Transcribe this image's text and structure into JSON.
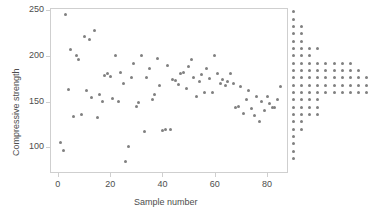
{
  "chart_data": {
    "type": "scatter",
    "title": "",
    "xlabel": "Sample number",
    "ylabel": "Compressive strength",
    "xlim": [
      -3,
      88
    ],
    "ylim": [
      72,
      252
    ],
    "xticks": [
      0,
      20,
      40,
      60,
      80
    ],
    "xtick_labels": [
      "0",
      "20",
      "40",
      "60",
      "80"
    ],
    "yticks": [
      100,
      150,
      200,
      250
    ],
    "ytick_labels": [
      "100",
      "150",
      "200",
      "250"
    ],
    "grid": false,
    "legend": "none",
    "marker_color": "#808080",
    "axis_color": "#cfcfcf",
    "text_color": "#4d4d4d",
    "x": [
      1,
      2,
      3,
      4,
      5,
      6,
      7,
      8,
      9,
      10,
      11,
      12,
      13,
      14,
      15,
      16,
      17,
      18,
      19,
      20,
      21,
      22,
      23,
      24,
      25,
      26,
      27,
      28,
      29,
      30,
      31,
      32,
      33,
      34,
      35,
      36,
      37,
      38,
      39,
      40,
      41,
      42,
      43,
      44,
      45,
      46,
      47,
      48,
      49,
      50,
      51,
      52,
      53,
      54,
      55,
      56,
      57,
      58,
      59,
      60,
      61,
      62,
      63,
      64,
      65,
      66,
      67,
      68,
      69,
      70,
      71,
      72,
      73,
      74,
      75,
      76,
      77,
      78,
      79,
      80,
      81,
      82,
      83,
      84,
      85
    ],
    "y": [
      105,
      97,
      245,
      163,
      207,
      134,
      200,
      196,
      136,
      221,
      162,
      218,
      154,
      228,
      133,
      158,
      150,
      178,
      181,
      177,
      153,
      200,
      150,
      182,
      170,
      85,
      101,
      176,
      191,
      145,
      149,
      200,
      117,
      176,
      186,
      152,
      158,
      197,
      167,
      118,
      120,
      189,
      119,
      174,
      173,
      169,
      181,
      182,
      164,
      188,
      196,
      176,
      156,
      172,
      179,
      160,
      186,
      175,
      160,
      200,
      181,
      170,
      174,
      167,
      172,
      181,
      170,
      144,
      145,
      166,
      137,
      152,
      162,
      142,
      135,
      156,
      128,
      150,
      140,
      155,
      148,
      144,
      143,
      152,
      166
    ],
    "dot_plot": {
      "description": "Horizontal dot plot (frequency distribution) of compressive strength at right of scatter",
      "orientation": "horizontal",
      "bin_values": [
        248,
        240,
        232,
        224,
        216,
        208,
        200,
        192,
        184,
        176,
        168,
        160,
        152,
        144,
        136,
        128,
        120,
        112,
        104,
        96,
        88
      ],
      "counts": [
        1,
        1,
        2,
        2,
        2,
        4,
        3,
        8,
        9,
        10,
        10,
        10,
        4,
        4,
        4,
        2,
        2,
        1,
        1,
        1,
        1
      ]
    }
  }
}
